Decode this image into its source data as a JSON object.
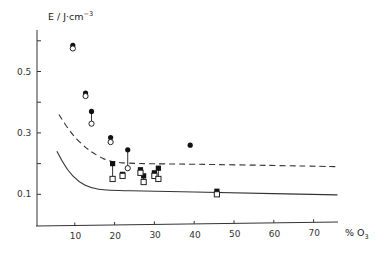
{
  "chart_data": {
    "type": "scatter",
    "title": "",
    "ylabel": "E / J·cm⁻³",
    "xlabel": "% O₃",
    "xlim": [
      0,
      76
    ],
    "ylim": [
      0,
      0.63
    ],
    "x_ticks": [
      10,
      20,
      30,
      40,
      50,
      60,
      70
    ],
    "y_ticks_labeled": [
      0.1,
      0.3,
      0.5
    ],
    "y_ticks_all": [
      0.1,
      0.2,
      0.3,
      0.4,
      0.5,
      0.6
    ],
    "grid": false,
    "legend": "none",
    "series": [
      {
        "name": "filled circles",
        "marker": "filled-circle",
        "points": [
          [
            9.5,
            0.585
          ],
          [
            12.7,
            0.43
          ],
          [
            14.2,
            0.37
          ],
          [
            19.0,
            0.285
          ],
          [
            23.3,
            0.245
          ],
          [
            39.0,
            0.26
          ]
        ]
      },
      {
        "name": "open circles",
        "marker": "open-circle",
        "points": [
          [
            9.5,
            0.575
          ],
          [
            12.7,
            0.42
          ],
          [
            14.2,
            0.33
          ],
          [
            19.0,
            0.27
          ],
          [
            23.3,
            0.185
          ]
        ]
      },
      {
        "name": "filled squares",
        "marker": "filled-square",
        "points": [
          [
            19.5,
            0.2
          ],
          [
            22.0,
            0.165
          ],
          [
            26.5,
            0.18
          ],
          [
            27.3,
            0.16
          ],
          [
            30.0,
            0.17
          ],
          [
            31.0,
            0.185
          ],
          [
            45.7,
            0.11
          ]
        ]
      },
      {
        "name": "open squares",
        "marker": "open-square",
        "points": [
          [
            19.5,
            0.15
          ],
          [
            22.0,
            0.16
          ],
          [
            26.5,
            0.17
          ],
          [
            27.3,
            0.14
          ],
          [
            30.0,
            0.16
          ],
          [
            31.0,
            0.15
          ],
          [
            45.7,
            0.1
          ]
        ]
      },
      {
        "name": "dashed curve",
        "style": "dashed-line",
        "points": [
          [
            6,
            0.36
          ],
          [
            9,
            0.3
          ],
          [
            12,
            0.26
          ],
          [
            15,
            0.23
          ],
          [
            19,
            0.205
          ],
          [
            25,
            0.2
          ],
          [
            40,
            0.198
          ],
          [
            60,
            0.194
          ],
          [
            76,
            0.19
          ]
        ]
      },
      {
        "name": "solid curve",
        "style": "solid-line",
        "points": [
          [
            5.5,
            0.24
          ],
          [
            8,
            0.18
          ],
          [
            11,
            0.14
          ],
          [
            14,
            0.12
          ],
          [
            18,
            0.113
          ],
          [
            30,
            0.11
          ],
          [
            50,
            0.105
          ],
          [
            76,
            0.098
          ]
        ]
      }
    ],
    "connectors": "vertical lines join filled/open marker pairs at the same x"
  }
}
